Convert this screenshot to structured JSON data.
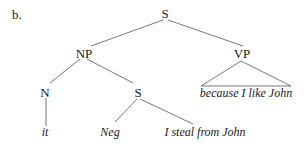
{
  "label": "b.",
  "tree": {
    "root": "S",
    "nodes": {
      "s_root": "S",
      "np": "NP",
      "vp": "VP",
      "n": "N",
      "s_embedded": "S",
      "it": "it",
      "neg": "Neg",
      "clause": "I steal from John",
      "vp_leaf": "because I like John"
    },
    "structure": "[S [NP [N it] [S Neg [I steal from John]]] [VP △ because I like John]]"
  },
  "colors": {
    "text": "#1a1a1a",
    "lines": "#6a6a6a",
    "background": "#ffffff"
  }
}
